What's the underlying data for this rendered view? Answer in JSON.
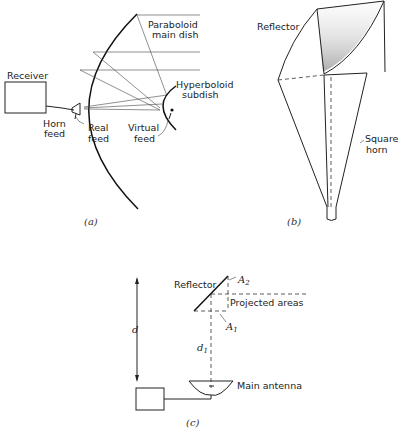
{
  "figure": {
    "panel_a": {
      "caption": "(a)",
      "labels": {
        "receiver": "Receiver",
        "paraboloid": "Paraboloid",
        "main_dish": "main dish",
        "hyperboloid": "Hyperboloid",
        "subdish": "subdish",
        "horn": "Horn",
        "horn_feed": "feed",
        "real": "Real",
        "real_feed": "feed",
        "virtual": "Virtual",
        "virtual_feed": "feed"
      }
    },
    "panel_b": {
      "caption": "(b)",
      "labels": {
        "reflector": "Reflector",
        "square": "Square",
        "horn": "horn"
      }
    },
    "panel_c": {
      "caption": "(c)",
      "labels": {
        "reflector": "Reflector",
        "a2": "A",
        "a2_sub": "2",
        "projected_areas": "Projected areas",
        "a1": "A",
        "a1_sub": "1",
        "d": "d",
        "d1": "d",
        "d1_sub": "1",
        "main_antenna": "Main antenna"
      }
    }
  }
}
